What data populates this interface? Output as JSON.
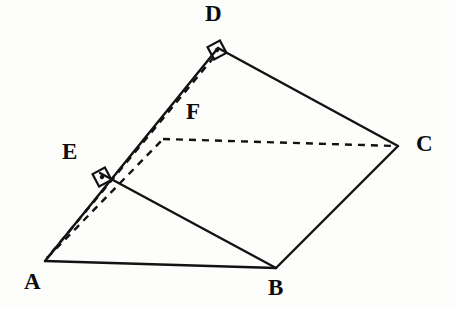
{
  "figure": {
    "background_color": "#fdfdfb",
    "ink_color": "#121212"
  },
  "labels": {
    "a": "A",
    "b": "B",
    "c": "C",
    "d": "D",
    "e": "E",
    "f": "F"
  },
  "points": {
    "A": {
      "name": "A",
      "x": 45,
      "y": 261
    },
    "B": {
      "name": "B",
      "x": 276,
      "y": 268
    },
    "C": {
      "name": "C",
      "x": 398,
      "y": 146
    },
    "D": {
      "name": "D",
      "x": 218,
      "y": 48
    },
    "E": {
      "name": "E",
      "x": 100,
      "y": 173
    },
    "F": {
      "name": "F",
      "x": 163,
      "y": 139
    }
  },
  "label_positions": {
    "A": {
      "x": 24,
      "y": 272
    },
    "B": {
      "x": 268,
      "y": 278
    },
    "C": {
      "x": 416,
      "y": 132
    },
    "D": {
      "x": 205,
      "y": 3
    },
    "E": {
      "x": 62,
      "y": 140
    },
    "F": {
      "x": 186,
      "y": 100
    }
  },
  "edges": {
    "solid": [
      {
        "name": "edge-A-D",
        "from": "A",
        "to": "D",
        "style": "solid"
      },
      {
        "name": "edge-D-C",
        "from": "D",
        "to": "C",
        "style": "solid"
      },
      {
        "name": "edge-C-B",
        "from": "C",
        "to": "B",
        "style": "solid"
      },
      {
        "name": "edge-B-A",
        "from": "B",
        "to": "A",
        "style": "solid"
      },
      {
        "name": "edge-E-B",
        "from": "E",
        "to": "B",
        "style": "solid"
      }
    ],
    "dashed": [
      {
        "name": "edge-D-A-dashed",
        "from": "D",
        "to": "A",
        "style": "dashed"
      },
      {
        "name": "edge-F-C-dashed",
        "from": "F",
        "to": "C",
        "style": "dashed"
      },
      {
        "name": "edge-A-F-dashed",
        "from": "A",
        "to": "F",
        "style": "dashed"
      }
    ]
  },
  "right_angles": [
    {
      "name": "right-angle-at-D",
      "at": "D",
      "x": 217,
      "y": 50,
      "rotation": -28,
      "size": 13,
      "marker": "square-with-dot"
    },
    {
      "name": "right-angle-at-E",
      "at": "E",
      "x": 102,
      "y": 177,
      "rotation": -28,
      "size": 13,
      "marker": "square-with-dot"
    }
  ]
}
